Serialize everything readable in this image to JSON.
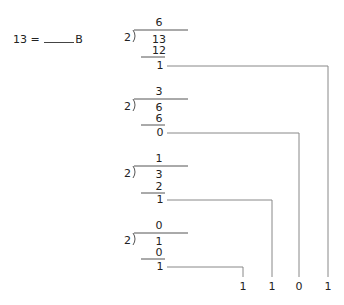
{
  "problem": {
    "lhs": "13 =",
    "suffix": "B"
  },
  "divisions": [
    {
      "divisor": "2",
      "quotient": "6",
      "dividend": "13",
      "subtract": "12",
      "remainder": "1"
    },
    {
      "divisor": "2",
      "quotient": "3",
      "dividend": "6",
      "subtract": "6",
      "remainder": "0"
    },
    {
      "divisor": "2",
      "quotient": "1",
      "dividend": "3",
      "subtract": "2",
      "remainder": "1"
    },
    {
      "divisor": "2",
      "quotient": "0",
      "dividend": "1",
      "subtract": "0",
      "remainder": "1"
    }
  ],
  "result_bits": [
    "1",
    "1",
    "0",
    "1"
  ],
  "colors": {
    "text": "#222222",
    "lines": "#888888"
  }
}
